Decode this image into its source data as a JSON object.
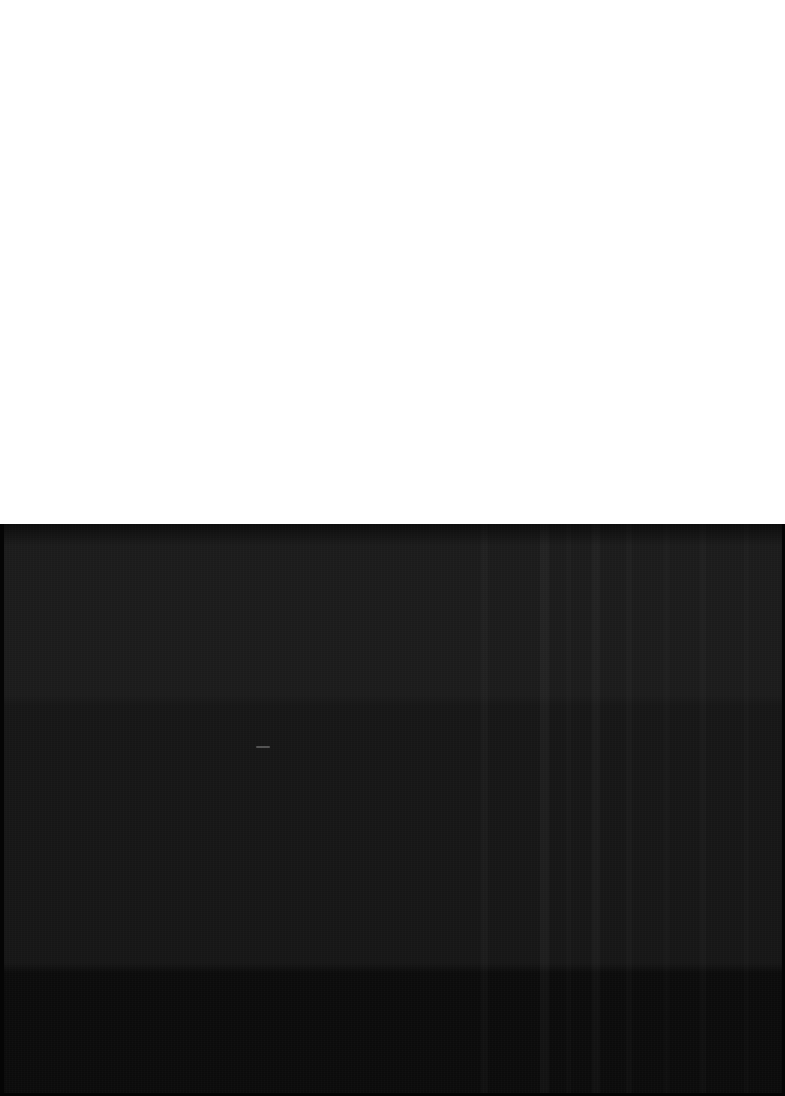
{
  "capture": {
    "width": 785,
    "height": 1096,
    "description": "Underexposed screen capture: blank white upper area over a near-black lower frame",
    "visible_text": ""
  },
  "regions": {
    "blank": {
      "name": "blank-white-area",
      "label": "",
      "top": 0,
      "height": 524,
      "color": "#ffffff"
    },
    "dark": {
      "name": "dark-capture-area",
      "label": "",
      "top": 524,
      "height": 572,
      "base_color": "#141414"
    }
  },
  "bands": [
    {
      "name": "upper-band",
      "label": "",
      "top": 524,
      "height": 176,
      "color": "#1b1b1b"
    },
    {
      "name": "middle-band",
      "label": "",
      "top": 700,
      "height": 268,
      "color": "#161616"
    },
    {
      "name": "lower-band",
      "label": "",
      "top": 968,
      "height": 128,
      "color": "#0b0b0b"
    }
  ],
  "vertical_bands": [
    {
      "name": "vertical-band-1",
      "x": 481,
      "width": 7,
      "opacity": 0.022
    },
    {
      "name": "vertical-band-2",
      "x": 540,
      "width": 9,
      "opacity": 0.03
    },
    {
      "name": "vertical-band-3",
      "x": 566,
      "width": 5,
      "opacity": 0.014
    },
    {
      "name": "vertical-band-4",
      "x": 592,
      "width": 8,
      "opacity": 0.026
    },
    {
      "name": "vertical-band-5",
      "x": 626,
      "width": 6,
      "opacity": 0.02
    },
    {
      "name": "vertical-band-6",
      "x": 664,
      "width": 5,
      "opacity": 0.014
    },
    {
      "name": "vertical-band-7",
      "x": 700,
      "width": 6,
      "opacity": 0.018
    },
    {
      "name": "vertical-band-8",
      "x": 744,
      "width": 5,
      "opacity": 0.014
    }
  ],
  "artifacts": {
    "light_dash": {
      "name": "light-dash-artifact",
      "label": "",
      "x": 256,
      "y": 746,
      "width": 14,
      "height": 2,
      "color": "#c8c8c8"
    }
  },
  "edges": {
    "left": {
      "name": "left-edge-strip",
      "width": 4,
      "color": "#050505"
    },
    "right": {
      "name": "right-edge-strip",
      "width": 3,
      "color": "#050505"
    },
    "bottom": {
      "name": "bottom-edge-strip",
      "height": 3,
      "color": "#040404"
    }
  },
  "colors": {
    "background": "#ffffff",
    "dark_base": "#141414",
    "band_upper": "#1b1b1b",
    "band_middle": "#161616",
    "band_lower": "#0b0b0b",
    "edge": "#050505"
  }
}
